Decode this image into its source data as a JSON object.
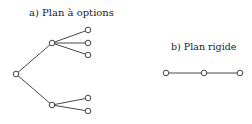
{
  "diagram": {
    "option_plan": {
      "label": "a) Plan à options",
      "nodes": [
        {
          "id": "root",
          "x": 16,
          "y": 74
        },
        {
          "id": "upper",
          "x": 52,
          "y": 43
        },
        {
          "id": "lower",
          "x": 52,
          "y": 105
        },
        {
          "id": "u1",
          "x": 88,
          "y": 30
        },
        {
          "id": "u2",
          "x": 88,
          "y": 43
        },
        {
          "id": "u3",
          "x": 88,
          "y": 55
        },
        {
          "id": "l1",
          "x": 88,
          "y": 98
        },
        {
          "id": "l2",
          "x": 88,
          "y": 111
        }
      ],
      "edges": [
        [
          "root",
          "upper"
        ],
        [
          "root",
          "lower"
        ],
        [
          "upper",
          "u1"
        ],
        [
          "upper",
          "u2"
        ],
        [
          "upper",
          "u3"
        ],
        [
          "lower",
          "l1"
        ],
        [
          "lower",
          "l2"
        ]
      ]
    },
    "rigid_plan": {
      "label": "b) Plan rigide",
      "nodes": [
        {
          "id": "r1",
          "x": 166,
          "y": 73
        },
        {
          "id": "r2",
          "x": 204,
          "y": 73
        },
        {
          "id": "r3",
          "x": 240,
          "y": 73
        }
      ],
      "edges": [
        [
          "r1",
          "r2"
        ],
        [
          "r2",
          "r3"
        ]
      ]
    },
    "colors": {
      "stroke": "#333333",
      "fill": "#ffffff"
    }
  }
}
